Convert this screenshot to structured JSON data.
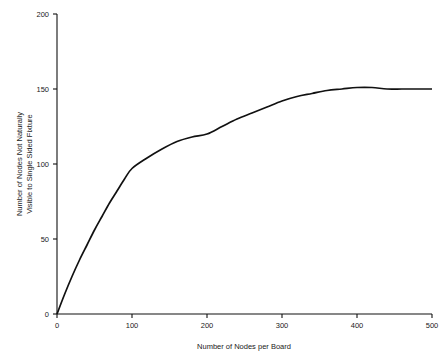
{
  "chart_data": {
    "type": "line",
    "title": "",
    "xlabel": "Number of Nodes per Board",
    "ylabel": "Number of Nodes Not Naturally\nVisible to Single Sided Fixture",
    "ylabel_line1": "Number of Nodes Not Naturally",
    "ylabel_line2": "Visible to Single Sided Fixture",
    "xlim": [
      0,
      500
    ],
    "ylim": [
      0,
      200
    ],
    "xticks": [
      0,
      100,
      200,
      300,
      400,
      500
    ],
    "yticks": [
      0,
      50,
      100,
      150,
      200
    ],
    "xtick_labels": [
      "0",
      "100",
      "200",
      "300",
      "400",
      "500"
    ],
    "ytick_labels": [
      "0",
      "50",
      "100",
      "150",
      "200"
    ],
    "grid": false,
    "legend": null,
    "series": [
      {
        "name": "Nodes not naturally visible",
        "x": [
          0,
          10,
          20,
          30,
          40,
          50,
          60,
          70,
          80,
          90,
          100,
          120,
          140,
          160,
          180,
          200,
          220,
          240,
          260,
          280,
          300,
          320,
          340,
          360,
          380,
          400,
          420,
          440,
          460,
          480,
          500
        ],
        "y": [
          0,
          13,
          25,
          36,
          46,
          56,
          65,
          74,
          82,
          90,
          97,
          104,
          110,
          115,
          118,
          120,
          125,
          130,
          134,
          138,
          142,
          145,
          147,
          149,
          150,
          151,
          151,
          150,
          150,
          150,
          150
        ]
      }
    ],
    "annotations": [],
    "colors": {
      "curve": "#111111",
      "axis": "#111111",
      "background": "#ffffff",
      "text": "#1a1a1a"
    }
  }
}
